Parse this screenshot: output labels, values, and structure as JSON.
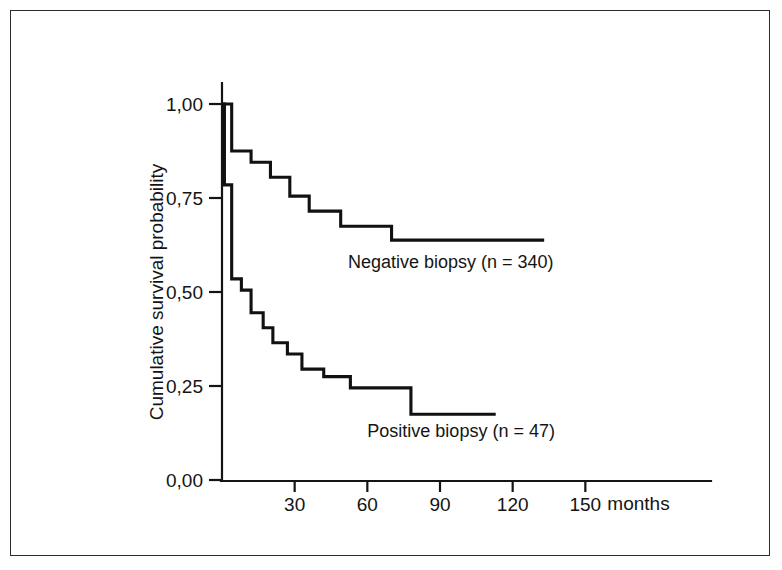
{
  "figure": {
    "frame_color": "#2b2b33",
    "background": "#ffffff"
  },
  "chart_data": {
    "type": "line",
    "subtype": "kaplan-meier-step",
    "title": "",
    "xlabel": "months",
    "ylabel": "Cumulative survival probability",
    "xlim": [
      0,
      160
    ],
    "ylim": [
      0,
      1.0
    ],
    "grid": false,
    "legend_position": "inline-annotation",
    "x_ticks": [
      30,
      60,
      90,
      120,
      150
    ],
    "x_tick_labels": [
      "30",
      "60",
      "90",
      "120",
      "150"
    ],
    "x_unit_label": "months",
    "y_ticks": [
      0.0,
      0.25,
      0.5,
      0.75,
      1.0
    ],
    "y_tick_labels": [
      "0,00",
      "0,25",
      "0,50",
      "0,75",
      "1,00"
    ],
    "decimal_separator": ",",
    "line_color": "#111111",
    "series": [
      {
        "name": "Negative biopsy (n = 340)",
        "label": "Negative biopsy (n = 340)",
        "n": 340,
        "label_x": 52,
        "label_y": 0.565,
        "steps": [
          [
            0,
            1.0
          ],
          [
            4,
            1.0
          ],
          [
            4,
            0.875
          ],
          [
            12,
            0.875
          ],
          [
            12,
            0.845
          ],
          [
            20,
            0.845
          ],
          [
            20,
            0.805
          ],
          [
            28,
            0.805
          ],
          [
            28,
            0.755
          ],
          [
            36,
            0.755
          ],
          [
            36,
            0.715
          ],
          [
            49,
            0.715
          ],
          [
            49,
            0.675
          ],
          [
            70,
            0.675
          ],
          [
            70,
            0.638
          ],
          [
            133,
            0.638
          ]
        ]
      },
      {
        "name": "Positive biopsy (n = 47)",
        "label": "Positive biopsy (n = 47)",
        "n": 47,
        "label_x": 60,
        "label_y": 0.115,
        "steps": [
          [
            0,
            1.0
          ],
          [
            1,
            1.0
          ],
          [
            1,
            0.785
          ],
          [
            4,
            0.785
          ],
          [
            4,
            0.535
          ],
          [
            8,
            0.535
          ],
          [
            8,
            0.505
          ],
          [
            12,
            0.505
          ],
          [
            12,
            0.445
          ],
          [
            17,
            0.445
          ],
          [
            17,
            0.405
          ],
          [
            21,
            0.405
          ],
          [
            21,
            0.365
          ],
          [
            27,
            0.365
          ],
          [
            27,
            0.335
          ],
          [
            33,
            0.335
          ],
          [
            33,
            0.295
          ],
          [
            42,
            0.295
          ],
          [
            42,
            0.275
          ],
          [
            53,
            0.275
          ],
          [
            53,
            0.245
          ],
          [
            78,
            0.245
          ],
          [
            78,
            0.175
          ],
          [
            113,
            0.175
          ]
        ]
      }
    ]
  }
}
